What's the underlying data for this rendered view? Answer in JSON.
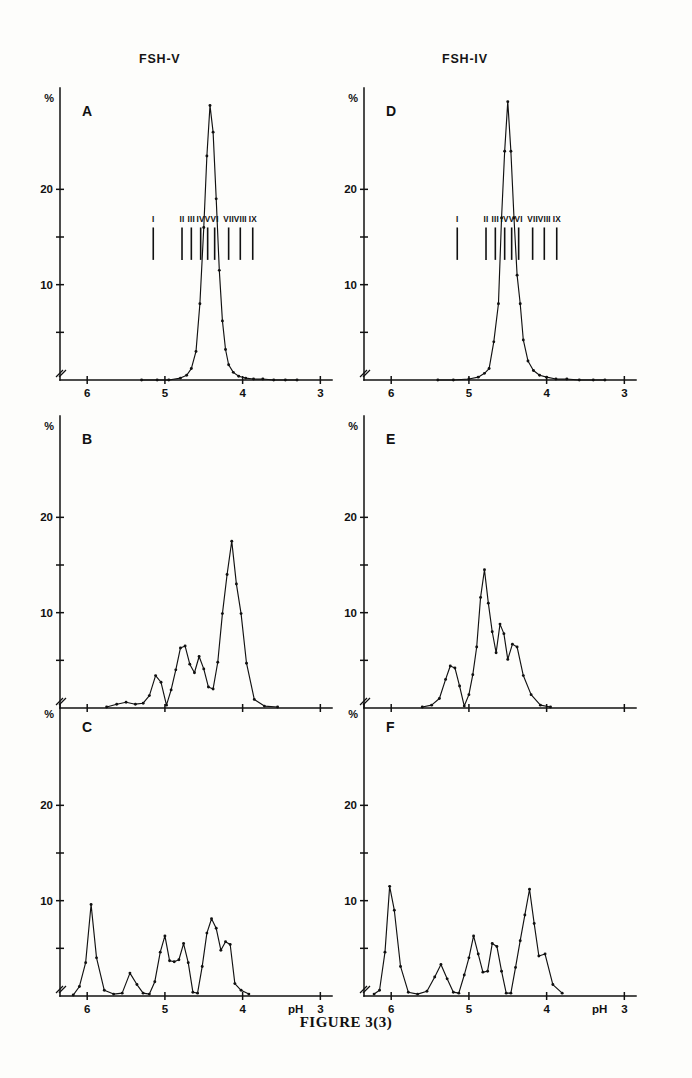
{
  "figure": {
    "caption": "FIGURE 3(3)",
    "column_titles": [
      "FSH-V",
      "FSH-IV"
    ],
    "axis": {
      "y_unit_label": "%",
      "x_label": "pH",
      "x_ticks_labeled": [
        "6",
        "5",
        "4",
        "3"
      ],
      "x_ticks_all": [
        6,
        5,
        4,
        3
      ],
      "y_ticks_labeled": [
        "20",
        "10"
      ],
      "y_ticks_all": [
        5,
        10,
        15,
        20
      ],
      "x_range": [
        6.35,
        2.85
      ],
      "y_range": [
        0,
        30
      ]
    },
    "panel_letters": [
      "A",
      "B",
      "C",
      "D",
      "E",
      "F"
    ],
    "isoform_markers": {
      "labels": [
        "I",
        "II",
        "III",
        "IV",
        "V",
        "VI",
        "VII",
        "VIII",
        "IX"
      ],
      "ph_values": [
        5.15,
        4.78,
        4.66,
        4.54,
        4.45,
        4.36,
        4.18,
        4.03,
        3.87
      ]
    }
  },
  "chart_data": [
    {
      "id": "A",
      "type": "line",
      "title": "FSH-V",
      "panel_letter": "A",
      "xlabel": "pH",
      "ylabel": "%",
      "xlim": [
        6.35,
        2.85
      ],
      "ylim": [
        0,
        30
      ],
      "grid": false,
      "legend": "none",
      "x": [
        5.3,
        5.1,
        4.95,
        4.8,
        4.72,
        4.66,
        4.6,
        4.55,
        4.5,
        4.46,
        4.42,
        4.38,
        4.34,
        4.3,
        4.26,
        4.22,
        4.18,
        4.12,
        4.05,
        3.96,
        3.86,
        3.74,
        3.6,
        3.45,
        3.3
      ],
      "y": [
        0.0,
        0.0,
        0.0,
        0.2,
        0.5,
        1.2,
        3.0,
        8.0,
        16.0,
        23.5,
        28.8,
        26.0,
        19.0,
        11.5,
        6.2,
        3.2,
        1.6,
        0.8,
        0.4,
        0.2,
        0.1,
        0.1,
        0.0,
        0.0,
        0.0
      ]
    },
    {
      "id": "B",
      "type": "line",
      "title": "FSH-V",
      "panel_letter": "B",
      "xlabel": "pH",
      "ylabel": "%",
      "xlim": [
        6.35,
        2.85
      ],
      "ylim": [
        0,
        30
      ],
      "grid": false,
      "legend": "none",
      "x": [
        5.75,
        5.62,
        5.5,
        5.38,
        5.28,
        5.2,
        5.12,
        5.05,
        4.98,
        4.92,
        4.86,
        4.8,
        4.74,
        4.68,
        4.62,
        4.56,
        4.5,
        4.44,
        4.38,
        4.32,
        4.26,
        4.2,
        4.14,
        4.08,
        4.02,
        3.95,
        3.85,
        3.72,
        3.55
      ],
      "y": [
        0.1,
        0.4,
        0.6,
        0.4,
        0.5,
        1.3,
        3.4,
        2.7,
        0.3,
        1.9,
        4.0,
        6.3,
        6.5,
        4.6,
        3.7,
        5.4,
        4.1,
        2.2,
        2.0,
        4.8,
        9.9,
        14.0,
        17.5,
        13.0,
        9.9,
        4.7,
        0.9,
        0.2,
        0.1
      ]
    },
    {
      "id": "C",
      "type": "line",
      "title": "FSH-V",
      "panel_letter": "C",
      "xlabel": "pH",
      "ylabel": "%",
      "xlim": [
        6.35,
        2.85
      ],
      "ylim": [
        0,
        30
      ],
      "grid": false,
      "legend": "none",
      "x": [
        6.18,
        6.1,
        6.02,
        5.95,
        5.88,
        5.78,
        5.66,
        5.55,
        5.45,
        5.36,
        5.28,
        5.2,
        5.13,
        5.06,
        5.0,
        4.94,
        4.88,
        4.82,
        4.76,
        4.7,
        4.64,
        4.58,
        4.52,
        4.46,
        4.4,
        4.34,
        4.28,
        4.22,
        4.16,
        4.1,
        4.02,
        3.92
      ],
      "y": [
        0.1,
        1.0,
        3.5,
        9.6,
        4.0,
        0.6,
        0.2,
        0.3,
        2.4,
        1.2,
        0.3,
        0.2,
        1.5,
        4.6,
        6.3,
        3.7,
        3.6,
        3.8,
        5.5,
        3.5,
        0.4,
        0.3,
        3.1,
        6.6,
        8.1,
        7.1,
        4.8,
        5.7,
        5.4,
        1.3,
        0.6,
        0.2
      ]
    },
    {
      "id": "D",
      "type": "line",
      "title": "FSH-IV",
      "panel_letter": "D",
      "xlabel": "pH",
      "ylabel": "%",
      "xlim": [
        6.35,
        2.85
      ],
      "ylim": [
        0,
        30
      ],
      "grid": false,
      "legend": "none",
      "x": [
        5.4,
        5.2,
        5.0,
        4.88,
        4.8,
        4.74,
        4.68,
        4.62,
        4.58,
        4.54,
        4.5,
        4.46,
        4.42,
        4.38,
        4.34,
        4.3,
        4.24,
        4.17,
        4.09,
        4.0,
        3.88,
        3.74,
        3.58,
        3.4,
        3.25
      ],
      "y": [
        0.0,
        0.0,
        0.1,
        0.3,
        0.7,
        1.2,
        4.0,
        8.0,
        17.0,
        24.0,
        29.2,
        24.0,
        17.0,
        11.0,
        8.0,
        4.2,
        2.0,
        1.0,
        0.5,
        0.3,
        0.1,
        0.1,
        0.0,
        0.0,
        0.0
      ]
    },
    {
      "id": "E",
      "type": "line",
      "title": "FSH-IV",
      "panel_letter": "E",
      "xlabel": "pH",
      "ylabel": "%",
      "xlim": [
        6.35,
        2.85
      ],
      "ylim": [
        0,
        30
      ],
      "grid": false,
      "legend": "none",
      "x": [
        5.6,
        5.48,
        5.38,
        5.3,
        5.24,
        5.18,
        5.12,
        5.06,
        5.0,
        4.95,
        4.9,
        4.85,
        4.8,
        4.75,
        4.7,
        4.65,
        4.6,
        4.55,
        4.5,
        4.44,
        4.38,
        4.3,
        4.2,
        4.08,
        3.95
      ],
      "y": [
        0.1,
        0.3,
        1.0,
        3.0,
        4.4,
        4.2,
        2.3,
        0.2,
        1.4,
        3.5,
        6.4,
        11.6,
        14.5,
        11.0,
        8.0,
        5.8,
        8.8,
        7.8,
        5.1,
        6.7,
        6.4,
        3.4,
        1.4,
        0.3,
        0.1
      ]
    },
    {
      "id": "F",
      "type": "line",
      "title": "FSH-IV",
      "panel_letter": "F",
      "xlabel": "pH",
      "ylabel": "%",
      "xlim": [
        6.35,
        2.85
      ],
      "ylim": [
        0,
        30
      ],
      "grid": false,
      "legend": "none",
      "x": [
        6.22,
        6.15,
        6.08,
        6.02,
        5.96,
        5.88,
        5.78,
        5.66,
        5.54,
        5.44,
        5.36,
        5.28,
        5.2,
        5.13,
        5.06,
        5.0,
        4.94,
        4.88,
        4.82,
        4.76,
        4.7,
        4.64,
        4.58,
        4.52,
        4.46,
        4.4,
        4.34,
        4.28,
        4.22,
        4.16,
        4.1,
        4.02,
        3.92,
        3.8
      ],
      "y": [
        0.2,
        0.6,
        4.6,
        11.5,
        9.0,
        3.1,
        0.4,
        0.2,
        0.5,
        2.0,
        3.3,
        1.8,
        0.4,
        0.3,
        2.2,
        4.0,
        6.3,
        4.4,
        2.5,
        2.6,
        5.5,
        5.2,
        2.6,
        0.3,
        0.3,
        3.0,
        5.8,
        8.5,
        11.2,
        7.6,
        4.2,
        4.4,
        1.2,
        0.3
      ]
    }
  ]
}
